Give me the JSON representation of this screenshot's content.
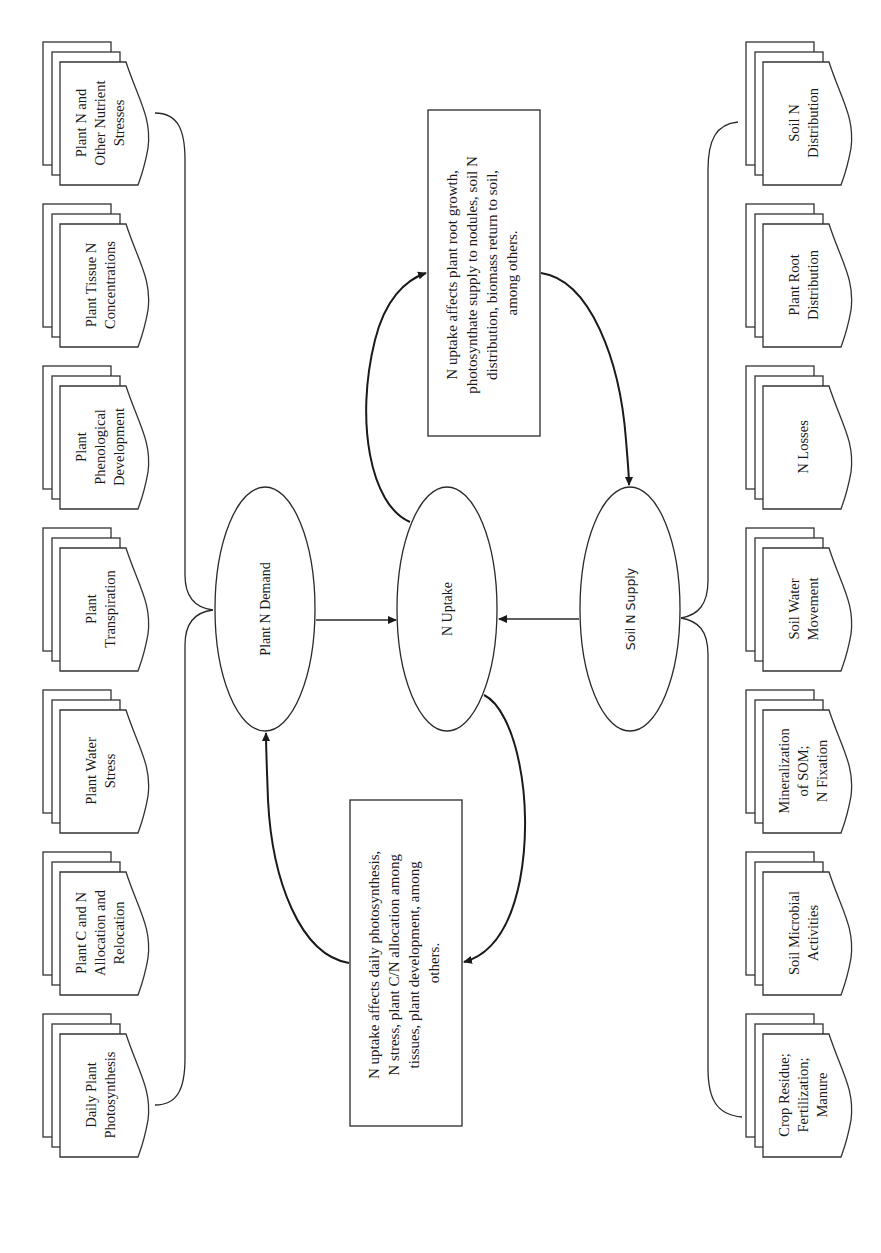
{
  "figure": {
    "orientation": "rotated-90-ccw",
    "nodes": {
      "plant_demand": "Plant N Demand",
      "uptake": "N Uptake",
      "soil_supply": "Soil N Supply"
    },
    "top_box": {
      "lines": [
        "N uptake affects plant root growth,",
        "photosynthate supply to nodules, soil N",
        "distribution, biomass return to soil,",
        "among others."
      ]
    },
    "bottom_box": {
      "lines": [
        "N uptake affects daily photosynthesis,",
        "N stress, plant C/N allocation among",
        "tissues, plant development, among",
        "others."
      ]
    },
    "plant_factors": [
      {
        "lines": [
          "Plant N and",
          "Other Nutrient",
          "Stresses"
        ]
      },
      {
        "lines": [
          "Plant Tissue N",
          "Concentrations"
        ]
      },
      {
        "lines": [
          "Plant",
          "Phenological",
          "Development"
        ]
      },
      {
        "lines": [
          "Plant",
          "Transpiration"
        ]
      },
      {
        "lines": [
          "Plant Water",
          "Stress"
        ]
      },
      {
        "lines": [
          "Plant C and N",
          "Allocation and",
          "Relocation"
        ]
      },
      {
        "lines": [
          "Daily Plant",
          "Photosynthesis"
        ]
      }
    ],
    "soil_factors": [
      {
        "lines": [
          "Soil N",
          "Distribution"
        ]
      },
      {
        "lines": [
          "Plant Root",
          "Distribution"
        ]
      },
      {
        "lines": [
          "N Losses"
        ]
      },
      {
        "lines": [
          "Soil Water",
          "Movement"
        ]
      },
      {
        "lines": [
          "Mineralization",
          "of SOM;",
          "N Fixation"
        ]
      },
      {
        "lines": [
          "Soil Microbial",
          "Activities"
        ]
      },
      {
        "lines": [
          "Crop Residue;",
          "Fertilization;",
          "Manure"
        ]
      }
    ],
    "colors": {
      "stroke": "#2a2a2a",
      "background": "#ffffff",
      "text": "#1a1a1a"
    }
  }
}
